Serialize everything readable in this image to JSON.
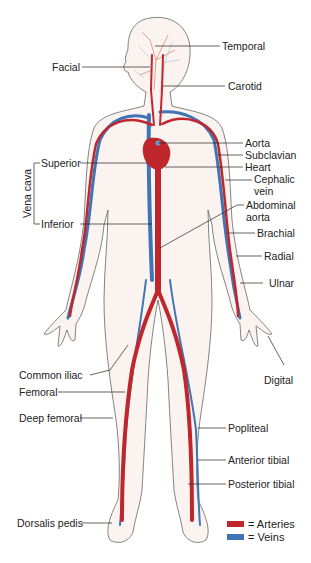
{
  "colors": {
    "artery": "#c0272d",
    "vein": "#3f74b5",
    "outline": "#555555",
    "skin": "#fbf3ef"
  },
  "labels": {
    "temporal": "Temporal",
    "facial": "Facial",
    "carotid": "Carotid",
    "aorta": "Aorta",
    "subclavian": "Subclavian",
    "heart": "Heart",
    "cephalic_1": "Cephalic",
    "cephalic_2": "vein",
    "superior": "Superior",
    "vena_cava": "Vena cava",
    "inferior": "Inferior",
    "abdominal_1": "Abdominal",
    "abdominal_2": "aorta",
    "brachial": "Brachial",
    "radial": "Radial",
    "ulnar": "Ulnar",
    "digital": "Digital",
    "common_iliac": "Common iliac",
    "femoral": "Femoral",
    "deep_femoral": "Deep femoral",
    "popliteal": "Popliteal",
    "anterior_tibial": "Anterior tibial",
    "posterior_tibial": "Posterior tibial",
    "dorsalis_pedis": "Dorsalis pedis"
  },
  "legend": [
    {
      "label": "= Arteries",
      "color": "#c0272d"
    },
    {
      "label": "= Veins",
      "color": "#3f74b5"
    }
  ]
}
